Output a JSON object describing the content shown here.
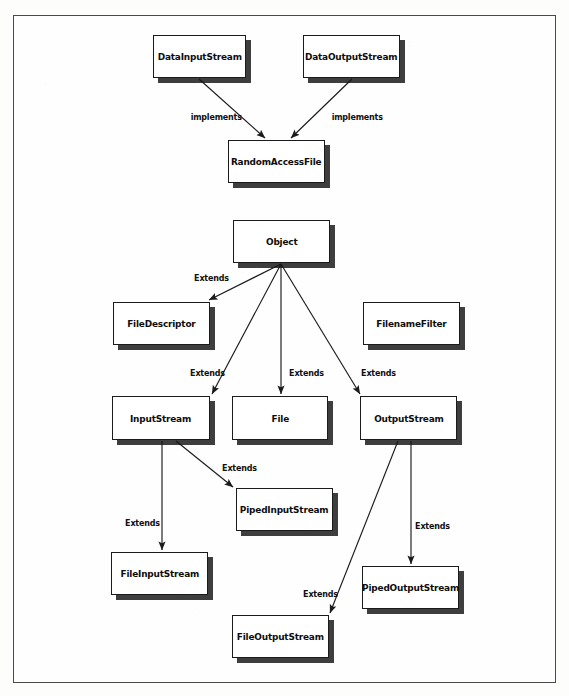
{
  "figure": {
    "kind": "uml-class-hierarchy",
    "frame": {
      "x": 13,
      "y": 15,
      "width": 543,
      "height": 668,
      "border_color": "#4a4a48"
    },
    "canvas": {
      "width": 569,
      "height": 696,
      "background": "#fdfdfc"
    },
    "box_style": {
      "fill": "#ffffff",
      "stroke": "#1b1b1b",
      "shadow": "#141414"
    },
    "edge_style": {
      "stroke": "#1b1b1b",
      "arrowhead": "solid-triangle"
    }
  },
  "nodes": [
    {
      "id": "DataInputStream",
      "label": "DataInputStream",
      "x": 153,
      "y": 35,
      "w": 93,
      "h": 43
    },
    {
      "id": "DataOutputStream",
      "label": "DataOutputStream",
      "x": 303,
      "y": 35,
      "w": 97,
      "h": 43
    },
    {
      "id": "RandomAccessFile",
      "label": "RandomAccessFile",
      "x": 228,
      "y": 140,
      "w": 97,
      "h": 43
    },
    {
      "id": "Object",
      "label": "Object",
      "x": 233,
      "y": 220,
      "w": 97,
      "h": 43
    },
    {
      "id": "FileDescriptor",
      "label": "FileDescriptor",
      "x": 113,
      "y": 302,
      "w": 97,
      "h": 43
    },
    {
      "id": "FilenameFilter",
      "label": "FilenameFilter",
      "x": 363,
      "y": 302,
      "w": 97,
      "h": 43
    },
    {
      "id": "InputStream",
      "label": "InputStream",
      "x": 112,
      "y": 396,
      "w": 98,
      "h": 44
    },
    {
      "id": "File",
      "label": "File",
      "x": 232,
      "y": 396,
      "w": 96,
      "h": 44
    },
    {
      "id": "OutputStream",
      "label": "OutputStream",
      "x": 360,
      "y": 396,
      "w": 97,
      "h": 44
    },
    {
      "id": "PipedInputStream",
      "label": "PipedInputStream",
      "x": 236,
      "y": 488,
      "w": 97,
      "h": 43
    },
    {
      "id": "FileInputStream",
      "label": "FileInputStream",
      "x": 111,
      "y": 552,
      "w": 97,
      "h": 43
    },
    {
      "id": "PipedOutputStream",
      "label": "PipedOutputStream",
      "x": 362,
      "y": 566,
      "w": 97,
      "h": 43
    },
    {
      "id": "FileOutputStream",
      "label": "FileOutputStream",
      "x": 232,
      "y": 615,
      "w": 97,
      "h": 43
    }
  ],
  "edges": [
    {
      "from": "DataInputStream",
      "to": "RandomAccessFile",
      "relation": "implements",
      "x1": 199,
      "y1": 79,
      "x2": 265,
      "y2": 138,
      "label_x": 189,
      "label_y": 112
    },
    {
      "from": "DataOutputStream",
      "to": "RandomAccessFile",
      "relation": "implements",
      "x1": 352,
      "y1": 79,
      "x2": 291,
      "y2": 138,
      "label_x": 330,
      "label_y": 112
    },
    {
      "from": "Object",
      "to": "FileDescriptor",
      "relation": "Extends",
      "x1": 281,
      "y1": 264,
      "x2": 209,
      "y2": 300,
      "label_x": 193,
      "label_y": 273
    },
    {
      "from": "Object",
      "to": "InputStream",
      "relation": "Extends",
      "x1": 281,
      "y1": 264,
      "x2": 212,
      "y2": 394,
      "label_x": 189,
      "label_y": 368
    },
    {
      "from": "Object",
      "to": "File",
      "relation": "Extends",
      "x1": 281,
      "y1": 264,
      "x2": 281,
      "y2": 394,
      "label_x": 288,
      "label_y": 368
    },
    {
      "from": "Object",
      "to": "OutputStream",
      "relation": "Extends",
      "x1": 281,
      "y1": 264,
      "x2": 360,
      "y2": 394,
      "label_x": 360,
      "label_y": 368
    },
    {
      "from": "InputStream",
      "to": "FileInputStream",
      "relation": "Extends",
      "x1": 162,
      "y1": 441,
      "x2": 162,
      "y2": 550,
      "label_x": 124,
      "label_y": 518
    },
    {
      "from": "InputStream",
      "to": "PipedInputStream",
      "relation": "Extends",
      "x1": 176,
      "y1": 441,
      "x2": 233,
      "y2": 487,
      "label_x": 221,
      "label_y": 463
    },
    {
      "from": "OutputStream",
      "to": "PipedOutputStream",
      "relation": "Extends",
      "x1": 411,
      "y1": 441,
      "x2": 411,
      "y2": 564,
      "label_x": 414,
      "label_y": 521
    },
    {
      "from": "OutputStream",
      "to": "FileOutputStream",
      "relation": "Extends",
      "x1": 398,
      "y1": 441,
      "x2": 330,
      "y2": 613,
      "label_x": 302,
      "label_y": 589
    }
  ]
}
